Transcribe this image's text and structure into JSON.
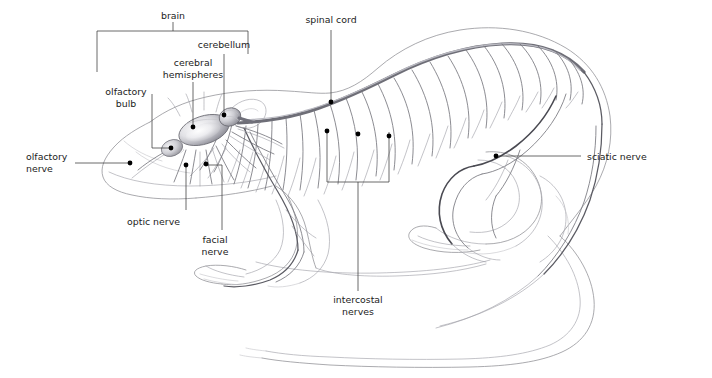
{
  "figure": {
    "background_color": "#ffffff",
    "label_color": "#1c1c1c",
    "leader_color": "#3a3a3a",
    "outline_color": "#8d8d93",
    "nerve_color": "#77777e",
    "cord_color": "#6e6e77"
  },
  "labels": {
    "brain": "brain",
    "cerebellum": "cerebellum",
    "cerebral_hemispheres_line1": "cerebral",
    "cerebral_hemispheres_line2": "hemispheres",
    "olfactory_bulb_line1": "olfactory",
    "olfactory_bulb_line2": "bulb",
    "olfactory_nerve_line1": "olfactory",
    "olfactory_nerve_line2": "nerve",
    "optic_nerve": "optic nerve",
    "facial_nerve_line1": "facial",
    "facial_nerve_line2": "nerve",
    "spinal_cord": "spinal cord",
    "intercostal_nerves_line1": "intercostal",
    "intercostal_nerves_line2": "nerves",
    "sciatic_nerve": "sciatic nerve"
  },
  "structures": [
    {
      "name": "brain",
      "kind": "bracket-group"
    },
    {
      "name": "cerebral-hemispheres",
      "kind": "organ"
    },
    {
      "name": "cerebellum",
      "kind": "organ"
    },
    {
      "name": "olfactory-bulb",
      "kind": "organ"
    },
    {
      "name": "olfactory-nerve",
      "kind": "nerve"
    },
    {
      "name": "optic-nerve",
      "kind": "nerve"
    },
    {
      "name": "facial-nerve",
      "kind": "nerve"
    },
    {
      "name": "spinal-cord",
      "kind": "nerve"
    },
    {
      "name": "intercostal-nerves",
      "kind": "nerve-group"
    },
    {
      "name": "sciatic-nerve",
      "kind": "nerve"
    }
  ]
}
